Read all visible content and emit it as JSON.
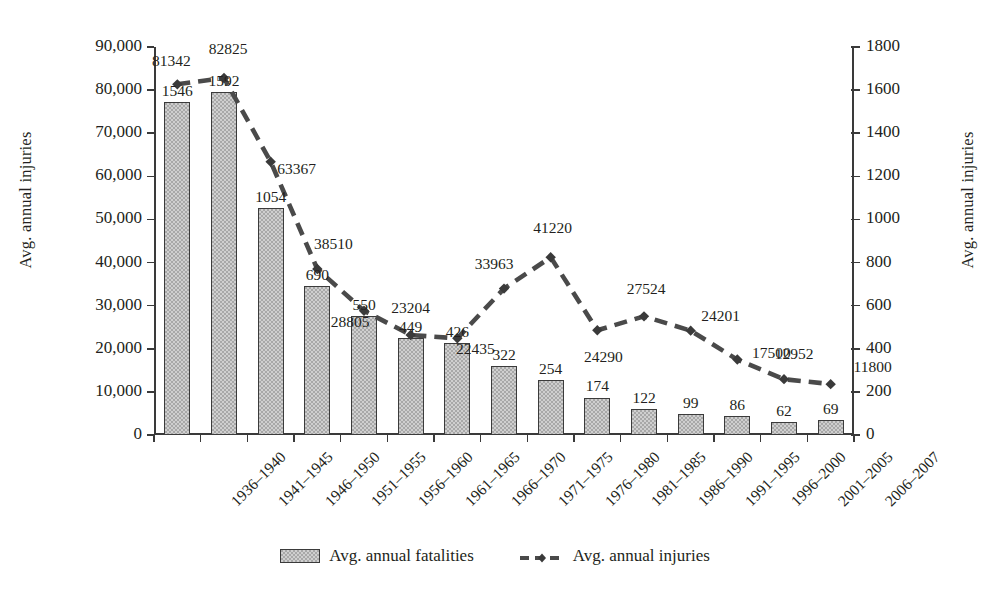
{
  "chart_data": {
    "type": "bar",
    "title": "",
    "categories": [
      "1936–1940",
      "1941–1945",
      "1946–1950",
      "1951–1955",
      "1956–1960",
      "1961–1965",
      "1966–1970",
      "1971–1975",
      "1976–1980",
      "1981–1985",
      "1986–1990",
      "1991–1995",
      "1996–2000",
      "2001–2005",
      "2006–2007"
    ],
    "xlabel": "",
    "ylabel": "Avg. annual injuries",
    "y2label": "Avg. annual injuries",
    "ylim": [
      0,
      90000
    ],
    "y2lim": [
      0,
      1800
    ],
    "yticks": [
      "0",
      "10,000",
      "20,000",
      "30,000",
      "40,000",
      "50,000",
      "60,000",
      "70,000",
      "80,000",
      "90,000"
    ],
    "ytick_values": [
      0,
      10000,
      20000,
      30000,
      40000,
      50000,
      60000,
      70000,
      80000,
      90000
    ],
    "y2ticks": [
      "0",
      "200",
      "400",
      "600",
      "800",
      "1000",
      "1200",
      "1400",
      "1600",
      "1800"
    ],
    "y2tick_values": [
      0,
      200,
      400,
      600,
      800,
      1000,
      1200,
      1400,
      1600,
      1800
    ],
    "grid": false,
    "legend_position": "bottom",
    "series": [
      {
        "name": "Avg. annual fatalities",
        "render": "bar",
        "axis": "right",
        "color": "#a8a8a8",
        "edge_color": "#3b3b3b",
        "values": [
          1546,
          1592,
          1054,
          690,
          550,
          449,
          426,
          322,
          254,
          174,
          122,
          99,
          86,
          62,
          69
        ],
        "labels": [
          "1546",
          "1592",
          "1054",
          "690",
          "550",
          "449",
          "426",
          "322",
          "254",
          "174",
          "122",
          "99",
          "86",
          "62",
          "69"
        ]
      },
      {
        "name": "Avg. annual injuries",
        "render": "line-dashed",
        "axis": "left",
        "color": "#4a4a4a",
        "marker": "diamond",
        "values": [
          81342,
          82825,
          63367,
          38510,
          28805,
          23204,
          22435,
          33963,
          41220,
          24290,
          27524,
          24201,
          17500,
          12952,
          11800
        ],
        "labels": [
          "81342",
          "82825",
          "63367",
          "38510",
          "28805",
          "23204",
          "22435",
          "33963",
          "41220",
          "24290",
          "27524",
          "24201",
          "17500",
          "12952",
          "11800"
        ],
        "label_positions": [
          "above-left",
          "above",
          "below-right",
          "above-right",
          "below-left",
          "above",
          "above-right",
          "above-left",
          "above",
          "below",
          "above",
          "above-right",
          "above-right",
          "above",
          "above-right"
        ]
      }
    ]
  },
  "legend": {
    "items": [
      {
        "label": "Avg. annual fatalities",
        "kind": "bar"
      },
      {
        "label": "Avg. annual injuries",
        "kind": "line"
      }
    ]
  }
}
